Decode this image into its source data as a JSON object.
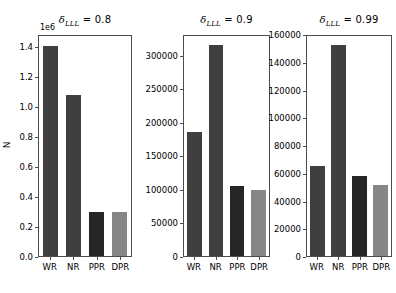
{
  "figure": {
    "width": 388,
    "height": 293,
    "background": "#ffffff",
    "ylabel": "N"
  },
  "colors": {
    "bar_wr": "#3f3f3f",
    "bar_nr": "#3f3f3f",
    "bar_ppr": "#262626",
    "bar_dpr": "#868686",
    "axis": "#4c4c4c",
    "text": "#000000"
  },
  "chart_data": [
    {
      "type": "bar",
      "title": "δLLL = 0.8",
      "title_symbol": "δ",
      "title_subscript": "LLL",
      "title_value": "= 0.8",
      "offset_text": "1e6",
      "categories": [
        "WR",
        "NR",
        "PPR",
        "DPR"
      ],
      "values": [
        1400000,
        1075000,
        295000,
        292000
      ],
      "tick_labels": [
        "0.0",
        "0.2",
        "0.4",
        "0.6",
        "0.8",
        "1.0",
        "1.2",
        "1.4"
      ],
      "tick_values": [
        0,
        200000,
        400000,
        600000,
        800000,
        1000000,
        1200000,
        1400000
      ],
      "ylim": [
        0,
        1480000
      ],
      "xlabel": "",
      "ylabel": "N",
      "grid": false,
      "legend": "none"
    },
    {
      "type": "bar",
      "title": "δLLL = 0.9",
      "title_symbol": "δ",
      "title_subscript": "LLL",
      "title_value": "= 0.9",
      "offset_text": "",
      "categories": [
        "WR",
        "NR",
        "PPR",
        "DPR"
      ],
      "values": [
        185000,
        315000,
        105000,
        98000
      ],
      "tick_labels": [
        "0",
        "50000",
        "100000",
        "150000",
        "200000",
        "250000",
        "300000"
      ],
      "tick_values": [
        0,
        50000,
        100000,
        150000,
        200000,
        250000,
        300000
      ],
      "ylim": [
        0,
        331000
      ],
      "xlabel": "",
      "ylabel": "",
      "grid": false,
      "legend": "none"
    },
    {
      "type": "bar",
      "title": "δLLL = 0.99",
      "title_symbol": "δ",
      "title_subscript": "LLL",
      "title_value": "= 0.99",
      "offset_text": "",
      "categories": [
        "WR",
        "NR",
        "PPR",
        "DPR"
      ],
      "values": [
        65000,
        152000,
        58000,
        51000
      ],
      "tick_labels": [
        "0",
        "20000",
        "40000",
        "60000",
        "80000",
        "100000",
        "120000",
        "140000",
        "160000"
      ],
      "tick_values": [
        0,
        20000,
        40000,
        60000,
        80000,
        100000,
        120000,
        140000,
        160000
      ],
      "ylim": [
        0,
        160000
      ],
      "xlabel": "",
      "ylabel": "",
      "grid": false,
      "legend": "none"
    }
  ]
}
